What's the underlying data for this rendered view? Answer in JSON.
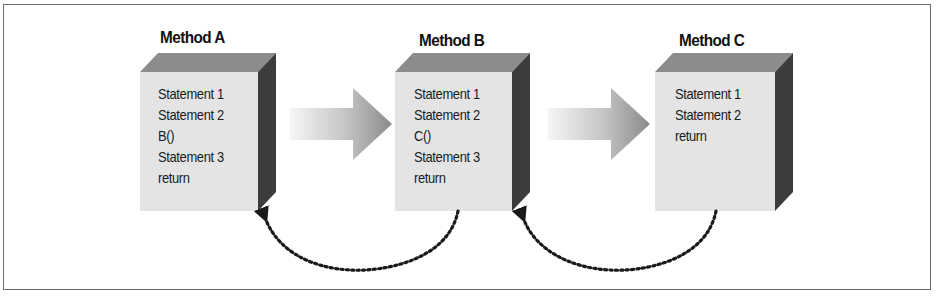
{
  "diagram": {
    "methods": [
      {
        "title": "Method A",
        "statements": [
          "Statement 1",
          "Statement 2",
          "B()",
          "Statement 3",
          "return"
        ]
      },
      {
        "title": "Method B",
        "statements": [
          "Statement 1",
          "Statement 2",
          "C()",
          "Statement 3",
          "return"
        ]
      },
      {
        "title": "Method C",
        "statements": [
          "Statement 1",
          "Statement 2",
          "return"
        ]
      }
    ],
    "connections": [
      {
        "from": "Method A",
        "to": "Method B",
        "type": "call",
        "style": "gradient-block-arrow"
      },
      {
        "from": "Method B",
        "to": "Method C",
        "type": "call",
        "style": "gradient-block-arrow"
      },
      {
        "from": "Method B",
        "to": "Method A",
        "type": "return",
        "style": "dotted-curve"
      },
      {
        "from": "Method C",
        "to": "Method B",
        "type": "return",
        "style": "dotted-curve"
      }
    ],
    "colors": {
      "box_front": "#e4e4e4",
      "box_top": "#8c8c8c",
      "box_side": "#3c3c3c",
      "arrow_light": "#f4f4f4",
      "arrow_dark": "#8a8a8a",
      "dots": "#1a1a1a",
      "frame": "#6a6a6a"
    }
  }
}
